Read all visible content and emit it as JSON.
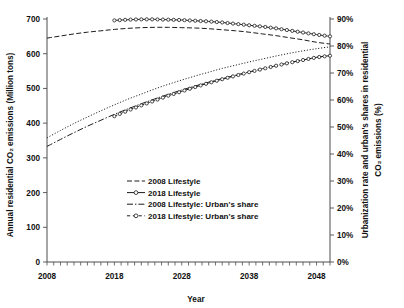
{
  "chart_data": {
    "type": "line",
    "title": "",
    "xlabel": "Year",
    "ylabel": "Annual residential CO₂ emissions (Million tons)",
    "y2label": "Urbanization rate and urban's shares in residential CO₂ emissions (%)",
    "xlim": [
      2008,
      2050
    ],
    "ylim": [
      0,
      700
    ],
    "y2lim": [
      0,
      90
    ],
    "grid": false,
    "legend_position": "center",
    "x_tick_labels": [
      "2008",
      "2018",
      "2028",
      "2038",
      "2048"
    ],
    "x_tick_values": [
      2008,
      2018,
      2028,
      2038,
      2048
    ],
    "x_minor_tick_step": 1,
    "y_tick_labels": [
      "0",
      "100",
      "200",
      "300",
      "400",
      "500",
      "600",
      "700"
    ],
    "y_tick_values": [
      0,
      100,
      200,
      300,
      400,
      500,
      600,
      700
    ],
    "y2_tick_labels": [
      "0%",
      "10%",
      "20%",
      "30%",
      "40%",
      "50%",
      "60%",
      "70%",
      "80%",
      "90%"
    ],
    "y2_tick_values": [
      0,
      10,
      20,
      30,
      40,
      50,
      60,
      70,
      80,
      90
    ],
    "series": [
      {
        "name": "2008 Lifestyle",
        "axis": "left",
        "style": "dashed",
        "marker": "none",
        "color": "#1c1c1c",
        "x": [
          2008,
          2010,
          2012,
          2014,
          2016,
          2018,
          2020,
          2022,
          2024,
          2026,
          2028,
          2030,
          2032,
          2034,
          2036,
          2038,
          2040,
          2042,
          2044,
          2046,
          2048,
          2050
        ],
        "values": [
          645,
          651,
          657,
          662,
          666,
          670,
          673,
          675,
          676,
          676,
          675,
          674,
          672,
          669,
          666,
          662,
          657,
          652,
          646,
          640,
          633,
          628
        ]
      },
      {
        "name": "2018 Lifestyle",
        "axis": "left",
        "style": "solid",
        "marker": "circle",
        "color": "#1c1c1c",
        "x": [
          2018,
          2020,
          2022,
          2024,
          2026,
          2028,
          2030,
          2032,
          2034,
          2036,
          2038,
          2040,
          2042,
          2044,
          2046,
          2048,
          2050
        ],
        "values": [
          696,
          698,
          699,
          699,
          698,
          697,
          695,
          693,
          690,
          686,
          682,
          678,
          673,
          667,
          661,
          655,
          650
        ]
      },
      {
        "name": "2008 Lifestyle: Urban's share",
        "axis": "right",
        "style": "dash-dot",
        "marker": "none",
        "color": "#1c1c1c",
        "x": [
          2008,
          2010,
          2012,
          2014,
          2016,
          2018,
          2020,
          2022,
          2024,
          2026,
          2028,
          2030,
          2032,
          2034,
          2036,
          2038,
          2040,
          2042,
          2044,
          2046,
          2048,
          2050
        ],
        "values": [
          42.8,
          45.4,
          47.9,
          50.3,
          52.5,
          54.7,
          56.7,
          58.6,
          60.4,
          62.1,
          63.7,
          65.2,
          66.6,
          67.9,
          69.2,
          70.4,
          71.6,
          72.7,
          73.8,
          74.8,
          75.8,
          76.6
        ]
      },
      {
        "name": "2018 Lifestyle: Urban's share",
        "axis": "right",
        "style": "dash-circle",
        "marker": "circle-open",
        "color": "#1c1c1c",
        "x": [
          2018,
          2020,
          2022,
          2024,
          2026,
          2028,
          2030,
          2032,
          2034,
          2036,
          2038,
          2040,
          2042,
          2044,
          2046,
          2048,
          2050
        ],
        "values": [
          54.0,
          56.1,
          58.0,
          59.8,
          61.6,
          63.2,
          64.8,
          66.3,
          67.7,
          69.0,
          70.3,
          71.5,
          72.7,
          73.8,
          74.8,
          75.8,
          76.4
        ]
      },
      {
        "name": "Urbanization rate",
        "axis": "right",
        "style": "dotted",
        "marker": "none",
        "color": "#1c1c1c",
        "x": [
          2008,
          2010,
          2012,
          2014,
          2016,
          2018,
          2020,
          2022,
          2024,
          2026,
          2028,
          2030,
          2032,
          2034,
          2036,
          2038,
          2040,
          2042,
          2044,
          2046,
          2048,
          2050
        ],
        "values": [
          46.0,
          48.7,
          51.3,
          53.7,
          56.0,
          58.2,
          60.3,
          62.2,
          64.1,
          65.8,
          67.4,
          68.9,
          70.3,
          71.7,
          72.9,
          74.1,
          75.2,
          76.3,
          77.3,
          78.2,
          79.0,
          79.7
        ]
      }
    ],
    "legend": [
      {
        "label": "2008 Lifestyle",
        "style": "dashed",
        "marker": "none"
      },
      {
        "label": "2018 Lifestyle",
        "style": "solid",
        "marker": "circle"
      },
      {
        "label": "2008 Lifestyle: Urban's share",
        "style": "dash-dot",
        "marker": "none"
      },
      {
        "label": "2018 Lifestyle: Urban's share",
        "style": "dash-circle",
        "marker": "circle-open"
      }
    ]
  },
  "colors": {
    "background": "#ffffff",
    "ink": "#1c1c1c",
    "axis": "#4d4d4d"
  }
}
